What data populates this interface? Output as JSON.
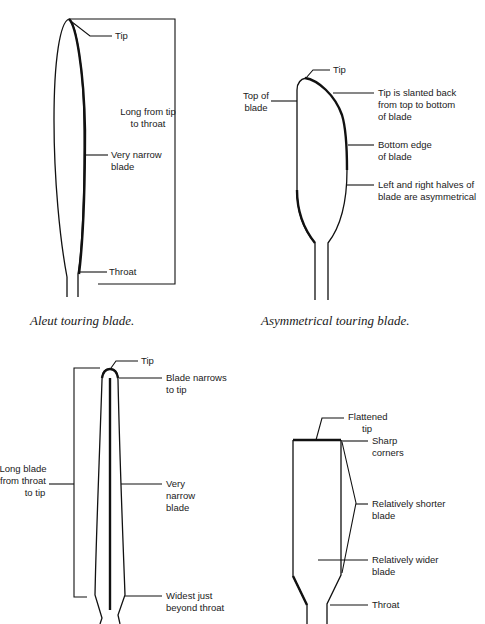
{
  "diagrams": [
    {
      "id": "aleut",
      "caption": "Aleut touring blade.",
      "labels": {
        "tip": "Tip",
        "length_1": "Long from tip",
        "length_2": "to throat",
        "narrow_1": "Very narrow",
        "narrow_2": "blade",
        "throat": "Throat"
      }
    },
    {
      "id": "asymmetrical",
      "caption": "Asymmetrical touring blade.",
      "labels": {
        "tip": "Tip",
        "top_1": "Top of",
        "top_2": "blade",
        "slant_1": "Tip is slanted back",
        "slant_2": "from top to bottom",
        "slant_3": "of blade",
        "bottom_1": "Bottom edge",
        "bottom_2": "of blade",
        "asym_1": "Left and right halves of",
        "asym_2": "blade are asymmetrical"
      }
    },
    {
      "id": "narrow-long",
      "caption": "",
      "labels": {
        "tip": "Tip",
        "narrows_1": "Blade narrows",
        "narrows_2": "to tip",
        "long_1": "Long blade",
        "long_2": "from throat",
        "long_3": "to tip",
        "narrow_1": "Very",
        "narrow_2": "narrow",
        "narrow_3": "blade",
        "widest_1": "Widest just",
        "widest_2": "beyond throat"
      }
    },
    {
      "id": "flat-tip",
      "caption": "",
      "labels": {
        "flat_1": "Flattened",
        "flat_2": "tip",
        "sharp_1": "Sharp",
        "sharp_2": "corners",
        "shorter_1": "Relatively shorter",
        "shorter_2": "blade",
        "wider_1": "Relatively wider",
        "wider_2": "blade",
        "throat": "Throat"
      }
    }
  ]
}
